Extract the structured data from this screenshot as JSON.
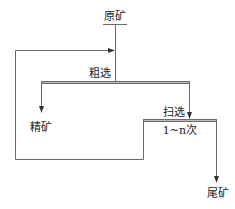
{
  "diagram": {
    "type": "flowsheet",
    "nodes": {
      "feed": {
        "label": "原矿"
      },
      "rougher": {
        "label": "粗选"
      },
      "concentrate": {
        "label": "精矿"
      },
      "scavenger": {
        "label": "扫选",
        "repeat_label": "1~n次"
      },
      "tailings": {
        "label": "尾矿"
      }
    },
    "edges": [
      {
        "from": "原矿",
        "to": "粗选"
      },
      {
        "from": "粗选",
        "to": "精矿"
      },
      {
        "from": "粗选",
        "to": "扫选"
      },
      {
        "from": "扫选",
        "to": "尾矿"
      },
      {
        "from": "扫选",
        "to": "粗选",
        "kind": "recycle"
      }
    ],
    "colors": {
      "line": "#6a6a6a",
      "bar_fill": "#bdbdbd",
      "text": "#222222"
    }
  }
}
